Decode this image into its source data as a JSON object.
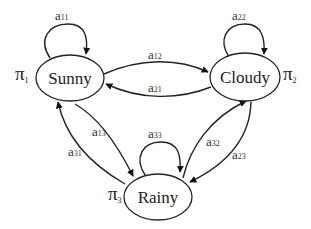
{
  "diagram": {
    "type": "markov-chain",
    "states": [
      {
        "id": "s1",
        "label": "Sunny",
        "initial_prob_symbol": "π",
        "initial_prob_index": "1"
      },
      {
        "id": "s2",
        "label": "Cloudy",
        "initial_prob_symbol": "π",
        "initial_prob_index": "2"
      },
      {
        "id": "s3",
        "label": "Rainy",
        "initial_prob_symbol": "π",
        "initial_prob_index": "3"
      }
    ],
    "transitions": [
      {
        "from": "Sunny",
        "to": "Sunny",
        "symbol": "a",
        "index": "11"
      },
      {
        "from": "Cloudy",
        "to": "Cloudy",
        "symbol": "a",
        "index": "22"
      },
      {
        "from": "Rainy",
        "to": "Rainy",
        "symbol": "a",
        "index": "33"
      },
      {
        "from": "Sunny",
        "to": "Cloudy",
        "symbol": "a",
        "index": "12"
      },
      {
        "from": "Cloudy",
        "to": "Sunny",
        "symbol": "a",
        "index": "21"
      },
      {
        "from": "Sunny",
        "to": "Rainy",
        "symbol": "a",
        "index": "13"
      },
      {
        "from": "Rainy",
        "to": "Sunny",
        "symbol": "a",
        "index": "31"
      },
      {
        "from": "Rainy",
        "to": "Cloudy",
        "symbol": "a",
        "index": "32"
      },
      {
        "from": "Cloudy",
        "to": "Rainy",
        "symbol": "a",
        "index": "23"
      }
    ]
  }
}
